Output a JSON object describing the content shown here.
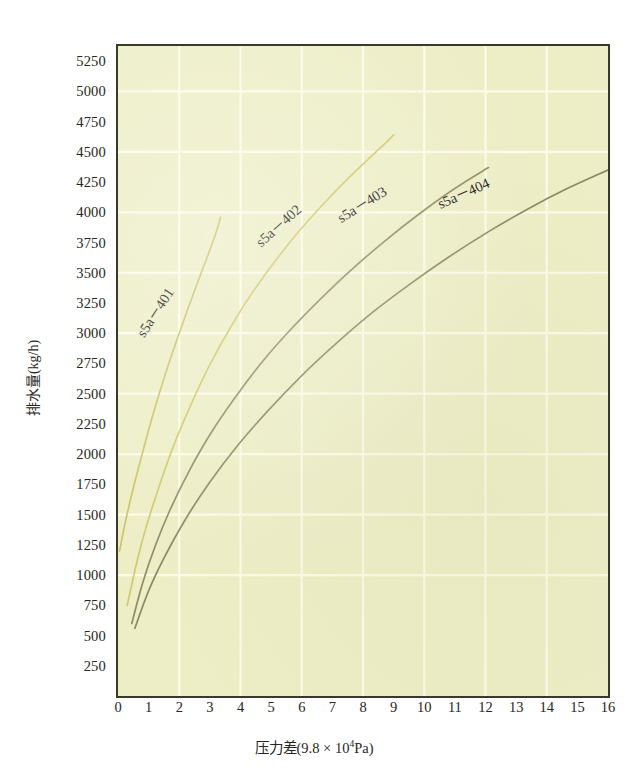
{
  "chart_data": {
    "type": "line",
    "title": "",
    "xlabel": "压力差(9.8 × 10⁴Pa)",
    "xlabel_main": "压力差(9.8 × 10",
    "xlabel_exp": "4",
    "xlabel_tail": "Pa)",
    "ylabel": "排水量(kg/h)",
    "xlim": [
      0,
      16
    ],
    "ylim": [
      0,
      5375
    ],
    "x_ticks": [
      0,
      1,
      2,
      3,
      4,
      5,
      6,
      7,
      8,
      9,
      10,
      11,
      12,
      13,
      14,
      15,
      16
    ],
    "y_ticks": [
      250,
      500,
      750,
      1000,
      1250,
      1500,
      1750,
      2000,
      2250,
      2500,
      2750,
      3000,
      3250,
      3500,
      3750,
      4000,
      4250,
      4500,
      4750,
      5000,
      5250
    ],
    "x_gridlines": [
      2,
      4,
      6,
      8,
      10,
      12,
      14
    ],
    "y_gridlines": [
      1000,
      1500,
      2000,
      2500,
      3000,
      3500,
      4000,
      4500,
      5000
    ],
    "grid": true,
    "legend_position": "inline-on-curve",
    "plot_bgcolor": "#edeec6",
    "grid_color": "#fbfbe8",
    "axis_color": "#3a3a2a",
    "series": [
      {
        "name": "s5a－401",
        "color": "#c9c469",
        "label_rotation": -57,
        "label_x": 1.35,
        "label_y": 3150,
        "points": [
          [
            0.05,
            1200
          ],
          [
            0.25,
            1450
          ],
          [
            0.5,
            1720
          ],
          [
            0.8,
            2010
          ],
          [
            1.1,
            2290
          ],
          [
            1.4,
            2545
          ],
          [
            1.7,
            2780
          ],
          [
            2.0,
            3000
          ],
          [
            2.3,
            3215
          ],
          [
            2.6,
            3420
          ],
          [
            2.9,
            3620
          ],
          [
            3.2,
            3830
          ],
          [
            3.35,
            3960
          ]
        ]
      },
      {
        "name": "s5a－402",
        "color": "#cfca6d",
        "label_rotation": -42,
        "label_x": 5.35,
        "label_y": 3860,
        "points": [
          [
            0.3,
            750
          ],
          [
            0.6,
            1090
          ],
          [
            0.9,
            1380
          ],
          [
            1.3,
            1700
          ],
          [
            1.8,
            2060
          ],
          [
            2.4,
            2420
          ],
          [
            3.0,
            2740
          ],
          [
            3.7,
            3060
          ],
          [
            4.4,
            3340
          ],
          [
            5.2,
            3620
          ],
          [
            6.0,
            3870
          ],
          [
            6.9,
            4120
          ],
          [
            7.8,
            4350
          ],
          [
            8.6,
            4540
          ],
          [
            9.0,
            4640
          ]
        ]
      },
      {
        "name": "s5a－403",
        "color": "#8f8d62",
        "label_rotation": -32,
        "label_x": 8.05,
        "label_y": 4030,
        "points": [
          [
            0.45,
            600
          ],
          [
            0.8,
            930
          ],
          [
            1.2,
            1230
          ],
          [
            1.7,
            1540
          ],
          [
            2.3,
            1850
          ],
          [
            3.0,
            2160
          ],
          [
            3.8,
            2460
          ],
          [
            4.7,
            2760
          ],
          [
            5.6,
            3020
          ],
          [
            6.6,
            3280
          ],
          [
            7.6,
            3520
          ],
          [
            8.7,
            3760
          ],
          [
            9.8,
            3980
          ],
          [
            10.9,
            4180
          ],
          [
            11.9,
            4340
          ],
          [
            12.1,
            4370
          ]
        ]
      },
      {
        "name": "s5a－404",
        "color": "#8a8860",
        "label_rotation": -24,
        "label_x": 11.35,
        "label_y": 4120,
        "points": [
          [
            0.55,
            560
          ],
          [
            1.0,
            870
          ],
          [
            1.5,
            1140
          ],
          [
            2.2,
            1460
          ],
          [
            3.0,
            1770
          ],
          [
            3.9,
            2070
          ],
          [
            4.9,
            2360
          ],
          [
            6.0,
            2650
          ],
          [
            7.1,
            2910
          ],
          [
            8.3,
            3170
          ],
          [
            9.5,
            3400
          ],
          [
            10.8,
            3630
          ],
          [
            12.1,
            3840
          ],
          [
            13.4,
            4030
          ],
          [
            14.7,
            4200
          ],
          [
            16.0,
            4350
          ]
        ]
      }
    ]
  }
}
